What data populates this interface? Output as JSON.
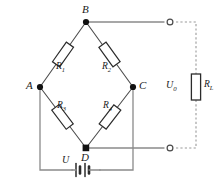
{
  "diagram": {
    "stroke_color": "#4d4d4d",
    "node_color": "#111111",
    "dashed_color": "#9a9a9a",
    "nodes": [
      {
        "id": "A",
        "label": "A",
        "x": 40,
        "y": 87
      },
      {
        "id": "B",
        "label": "B",
        "x": 86,
        "y": 22
      },
      {
        "id": "C",
        "label": "C",
        "x": 133,
        "y": 87
      },
      {
        "id": "D",
        "label": "D",
        "x": 86,
        "y": 148
      }
    ],
    "resistors": [
      {
        "id": "R1",
        "name": "R",
        "sub": "1"
      },
      {
        "id": "R2",
        "name": "R",
        "sub": "2"
      },
      {
        "id": "R3",
        "name": "R",
        "sub": "3"
      },
      {
        "id": "R4",
        "name": "R",
        "sub": "4"
      },
      {
        "id": "RL",
        "name": "R",
        "sub": "L"
      }
    ],
    "sources": [
      {
        "id": "U",
        "name": "U",
        "sub": ""
      },
      {
        "id": "U0",
        "name": "U",
        "sub": "0"
      }
    ],
    "terminals": [
      {
        "id": "out-top",
        "x": 170,
        "y": 22
      },
      {
        "id": "out-bottom",
        "x": 170,
        "y": 148
      }
    ]
  }
}
